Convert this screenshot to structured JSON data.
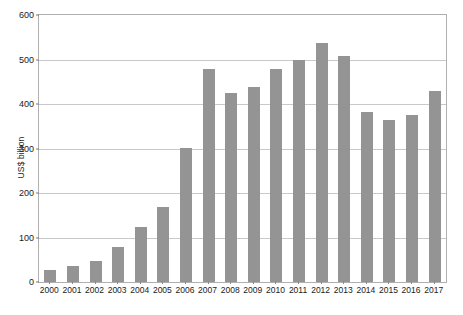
{
  "chart_data": {
    "type": "bar",
    "title": "",
    "subtitle": "",
    "xlabel": "",
    "ylabel": "US$ billion",
    "ylim": [
      0,
      600
    ],
    "yticks": [
      0,
      100,
      200,
      300,
      400,
      500,
      600
    ],
    "ytick_labels": [
      "0",
      "100",
      "200",
      "300",
      "400",
      "500",
      "600"
    ],
    "grid": true,
    "legend": null,
    "legend_position": "none",
    "bar_color": "#949494",
    "categories": [
      "2000",
      "2001",
      "2002",
      "2003",
      "2004",
      "2005",
      "2006",
      "2007",
      "2008",
      "2009",
      "2010",
      "2011",
      "2012",
      "2013",
      "2014",
      "2015",
      "2016",
      "2017"
    ],
    "values": [
      27,
      35,
      47,
      78,
      123,
      168,
      302,
      478,
      424,
      438,
      478,
      498,
      537,
      509,
      383,
      365,
      375,
      430
    ]
  }
}
